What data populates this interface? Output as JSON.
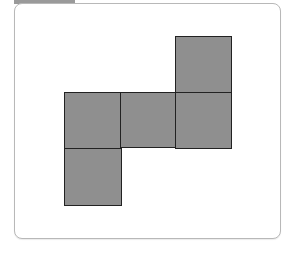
{
  "figure": {
    "fill_color": "#8f8f8f",
    "stroke_color": "#222222",
    "frame_border_color": "#b8b8b8",
    "tab_color": "#9a9a9a",
    "squares": [
      {
        "name": "square-top-right",
        "x": 175,
        "y": 36,
        "size": 57
      },
      {
        "name": "square-middle-left",
        "x": 64,
        "y": 92,
        "size": 57
      },
      {
        "name": "square-middle-center",
        "x": 120,
        "y": 92,
        "size": 56
      },
      {
        "name": "square-middle-right",
        "x": 175,
        "y": 92,
        "size": 57
      },
      {
        "name": "square-bottom-left",
        "x": 64,
        "y": 148,
        "size": 58
      }
    ]
  }
}
